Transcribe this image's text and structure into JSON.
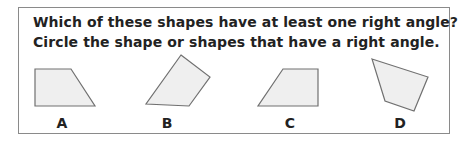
{
  "question": {
    "line1": "Which of these shapes have at least one right angle?",
    "line2": "Circle the shape or shapes that have a right angle."
  },
  "colors": {
    "shape_fill": "#efefef",
    "shape_stroke": "#707070",
    "border": "#8a8a8a",
    "text": "#222222"
  },
  "shapes": [
    {
      "label": "A",
      "points": "35,69 71,69 95,106 35,106"
    },
    {
      "label": "B",
      "points": "181,55 210,77 189,106 146,104"
    },
    {
      "label": "C",
      "points": "283,69 318,69 318,106 258,106"
    },
    {
      "label": "D",
      "points": "372,59 428,77 414,111 385,101"
    }
  ]
}
